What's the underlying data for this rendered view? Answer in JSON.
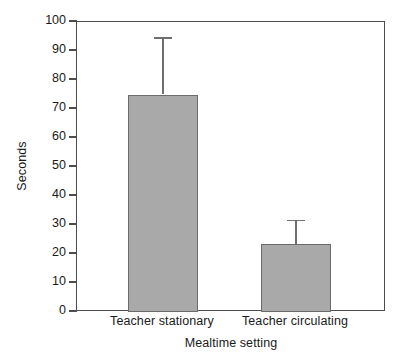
{
  "chart_data": {
    "type": "bar",
    "title": "",
    "xlabel": "Mealtime setting",
    "ylabel": "Seconds",
    "categories": [
      "Teacher stationary",
      "Teacher circulating"
    ],
    "values": [
      75,
      23.5
    ],
    "errors_upper": [
      19.5,
      8
    ],
    "series": [
      {
        "name": "Seconds",
        "values": [
          75,
          23.5
        ]
      }
    ],
    "ylim": [
      0,
      100
    ],
    "yticks": [
      0,
      10,
      20,
      30,
      40,
      50,
      60,
      70,
      80,
      90,
      100
    ],
    "ytick_labels": [
      "0",
      "10",
      "20",
      "30",
      "40",
      "50",
      "60",
      "70",
      "80",
      "90",
      "100"
    ],
    "grid": false,
    "legend": false,
    "legend_position": "none",
    "error_bar_style": "upper-only-with-caps",
    "bar_color": "#a9a9a9",
    "bar_edge_color": "#6b6b6b",
    "axis_color": "#4d4d4d",
    "error_bar_color": "#6f6f6f"
  },
  "axes": {
    "y_title": "Seconds",
    "x_title": "Mealtime setting"
  }
}
